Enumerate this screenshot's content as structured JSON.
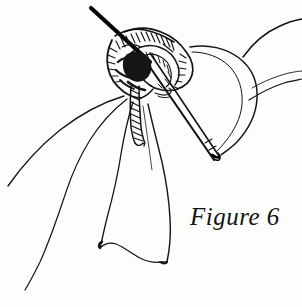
{
  "figure": {
    "caption": "Figure 6",
    "background_color": "#fdfdfb",
    "ink_color": "#141414",
    "elements": {
      "needle_icon": "needle-icon",
      "knot_icon": "knot-icon",
      "ribbon_loop_icon": "ribbon-loop-icon",
      "ribbon_tail_icon": "ribbon-tail-icon",
      "thread_icon": "thread-icon"
    }
  }
}
